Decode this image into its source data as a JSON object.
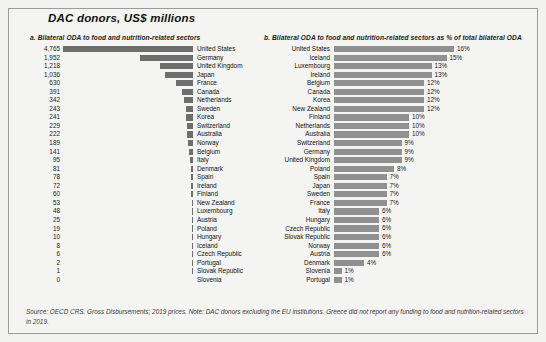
{
  "figure": {
    "title": "DAC donors, US$ millions",
    "footnote": "Source: OECD CRS. Gross Disbursements; 2019 prices. Note: DAC donors excluding the EU institutions. Greece did not report any funding to food and nutrition-related sectors in 2019.",
    "bar_color_left": "#6e6e6e",
    "bar_color_right": "#909090",
    "background": "#f4f4f2",
    "border_color": "#9b9b9b"
  },
  "chart_data": [
    {
      "type": "bar",
      "orientation": "horizontal",
      "panel": "a",
      "title": "a. Bilateral ODA to food and nutrition-related sectors",
      "xlabel": "",
      "ylabel": "",
      "grid": false,
      "legend": "none",
      "value_suffix": "",
      "xlim": [
        0,
        4765
      ],
      "categories": [
        "United States",
        "Germany",
        "United Kingdom",
        "Japan",
        "France",
        "Canada",
        "Netherlands",
        "Sweden",
        "Korea",
        "Switzerland",
        "Australia",
        "Norway",
        "Belgium",
        "Italy",
        "Denmark",
        "Spain",
        "Ireland",
        "Finland",
        "New Zealand",
        "Luxembourg",
        "Austria",
        "Poland",
        "Hungary",
        "Iceland",
        "Czech Republic",
        "Portugal",
        "Slovak Republic",
        "Slovenia"
      ],
      "values": [
        4765,
        1952,
        1218,
        1036,
        630,
        391,
        342,
        243,
        241,
        229,
        222,
        189,
        141,
        95,
        81,
        78,
        72,
        60,
        53,
        48,
        25,
        19,
        10,
        8,
        6,
        2,
        1,
        0
      ],
      "labels": [
        "4,765",
        "1,952",
        "1,218",
        "1,036",
        "630",
        "391",
        "342",
        "243",
        "241",
        "229",
        "222",
        "189",
        "141",
        "95",
        "81",
        "78",
        "72",
        "60",
        "53",
        "48",
        "25",
        "19",
        "10",
        "8",
        "6",
        "2",
        "1",
        "0"
      ]
    },
    {
      "type": "bar",
      "orientation": "horizontal",
      "panel": "b",
      "title": "b. Bilateral ODA to food and nutrition-related sectors as % of total bilateral ODA",
      "xlabel": "",
      "ylabel": "",
      "grid": false,
      "legend": "none",
      "value_suffix": "%",
      "xlim": [
        0,
        16
      ],
      "categories": [
        "United States",
        "Iceland",
        "Luxembourg",
        "Ireland",
        "Belgium",
        "Canada",
        "Korea",
        "New Zealand",
        "Finland",
        "Netherlands",
        "Australia",
        "Switzerland",
        "Germany",
        "United Kingdom",
        "Poland",
        "Spain",
        "Japan",
        "Sweden",
        "France",
        "Italy",
        "Hungary",
        "Czech Republic",
        "Slovak Republic",
        "Norway",
        "Austria",
        "Denmark",
        "Slovenia",
        "Portugal"
      ],
      "values": [
        16,
        15,
        13,
        13,
        12,
        12,
        12,
        12,
        10,
        10,
        10,
        9,
        9,
        9,
        8,
        7,
        7,
        7,
        7,
        6,
        6,
        6,
        6,
        6,
        6,
        4,
        1,
        1
      ],
      "labels": [
        "16%",
        "15%",
        "13%",
        "13%",
        "12%",
        "12%",
        "12%",
        "12%",
        "10%",
        "10%",
        "10%",
        "9%",
        "9%",
        "9%",
        "8%",
        "7%",
        "7%",
        "7%",
        "7%",
        "6%",
        "6%",
        "6%",
        "6%",
        "6%",
        "6%",
        "4%",
        "1%",
        "1%"
      ]
    }
  ]
}
